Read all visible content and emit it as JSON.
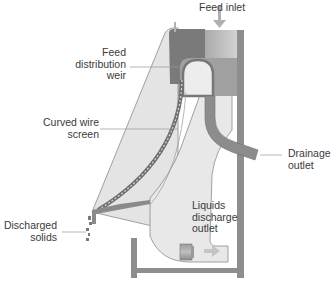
{
  "diagram": {
    "colors": {
      "background": "#ffffff",
      "housing_light": "#e4e4e4",
      "housing_outline": "#8a8a8a",
      "feed_box_dark": "#7c7c7c",
      "feed_box_mid": "#9c9c9c",
      "feed_box_light": "#c8c8c8",
      "frame": "#8e8e8e",
      "screen": "#6e6e6e",
      "label_text": "#3a3a3a",
      "leader_line": "#9a9a9a",
      "arrow": "#b0b0b0"
    },
    "labels": {
      "feed_inlet": {
        "lines": [
          "Feed inlet"
        ]
      },
      "feed_distribution_weir": {
        "lines": [
          "Feed",
          "distribution",
          "weir"
        ]
      },
      "curved_wire_screen": {
        "lines": [
          "Curved wire",
          "screen"
        ]
      },
      "drainage_outlet": {
        "lines": [
          "Drainage",
          "outlet"
        ]
      },
      "liquids_discharge_outlet": {
        "lines": [
          "Liquids",
          "discharge",
          "outlet"
        ]
      },
      "discharged_solids": {
        "lines": [
          "Discharged",
          "solids"
        ]
      }
    },
    "icons": {
      "feed_arrow": "down-arrow",
      "liquids_arrow": "right-arrow"
    }
  }
}
